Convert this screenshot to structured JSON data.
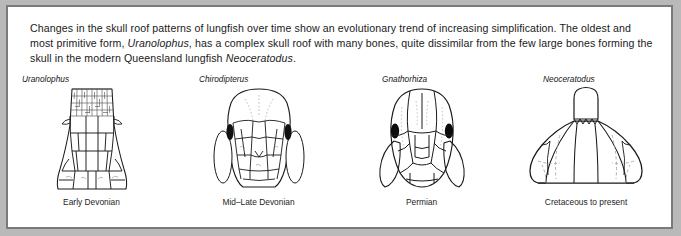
{
  "figure": {
    "caption": {
      "part1": "Changes in the skull roof patterns of lungfish  over time show an evolutionary trend of increasing simplification. The oldest and most primitive form, ",
      "genus_inline_1": "Uranolophus",
      "part2": ", has a complex skull roof with many bones, quite dissimilar from the few large bones forming the skull in the modern Queensland lungfish ",
      "genus_inline_2": "Neoceratodus",
      "part3": "."
    },
    "specimens": [
      {
        "genus": "Uranolophus",
        "period": "Early Devonian"
      },
      {
        "genus": "Chirodipterus",
        "period": "Mid–Late Devonian"
      },
      {
        "genus": "Gnathorhiza",
        "period": "Permian"
      },
      {
        "genus": "Neoceratodus",
        "period": "Cretaceous to present"
      }
    ],
    "colors": {
      "page_background": "#b9b9b9",
      "panel_background": "#ffffff",
      "panel_border": "#7a7a7a",
      "ink": "#1a1a1a",
      "orbit_fill": "#000000",
      "suture_line": "#9a9a9a"
    }
  }
}
